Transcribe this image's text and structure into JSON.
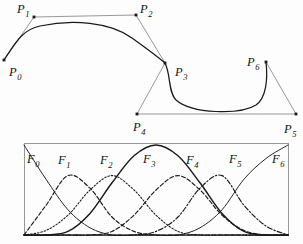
{
  "figure": {
    "title_text": "",
    "background_color": "#ffffff",
    "ink_color": "#1a1a1a",
    "polygon_color": "#8e8e8e"
  },
  "control_polygon": {
    "name": "control-polygon",
    "points": [
      {
        "label": "P",
        "sub": "0",
        "x": 4,
        "y": 60,
        "lx": 9,
        "ly": 76
      },
      {
        "label": "P",
        "sub": "1",
        "x": 34,
        "y": 17,
        "lx": 17,
        "ly": 13
      },
      {
        "label": "P",
        "sub": "2",
        "x": 136,
        "y": 15,
        "lx": 140,
        "ly": 13
      },
      {
        "label": "P",
        "sub": "3",
        "x": 165,
        "y": 63,
        "lx": 175,
        "ly": 76
      },
      {
        "label": "P",
        "sub": "4",
        "x": 137,
        "y": 114,
        "lx": 133,
        "ly": 131
      },
      {
        "label": "P",
        "sub": "5",
        "x": 296,
        "y": 114,
        "lx": 284,
        "ly": 133
      },
      {
        "label": "P",
        "sub": "6",
        "x": 266,
        "y": 62,
        "lx": 247,
        "ly": 66
      }
    ],
    "hull_path": "M4,60 L34,17 L136,15 L165,63 L137,114 L296,114 L266,62",
    "curve_path_upper": "M4,60 C16,42 22,30 40,26 C72,19 110,22 132,38 C150,51 158,57 165,63",
    "curve_path_lower": "M165,63 C171,75 168,92 176,100 C192,114 240,115 256,105 C266,98 268,80 266,62"
  },
  "basis_plot": {
    "name": "basis-function-plot",
    "frame": {
      "x": 24,
      "y": 143,
      "width": 264,
      "height": 92
    },
    "axis_note": "",
    "curves": [
      {
        "label": "F",
        "sub": "0",
        "lx": 27,
        "ly": 163,
        "style": "solid-thin"
      },
      {
        "label": "F",
        "sub": "1",
        "lx": 58,
        "ly": 164,
        "style": "dashed"
      },
      {
        "label": "F",
        "sub": "2",
        "lx": 100,
        "ly": 164,
        "style": "dotted"
      },
      {
        "label": "F",
        "sub": "3",
        "lx": 143,
        "ly": 163,
        "style": "solid-thick"
      },
      {
        "label": "F",
        "sub": "4",
        "lx": 186,
        "ly": 164,
        "style": "dashed"
      },
      {
        "label": "F",
        "sub": "5",
        "lx": 229,
        "ly": 163,
        "style": "dash-dot"
      },
      {
        "label": "F",
        "sub": "6",
        "lx": 272,
        "ly": 163,
        "style": "solid-thin"
      }
    ]
  },
  "chart_data": {
    "type": "line",
    "xlabel": "",
    "ylabel": "",
    "xlim": [
      0,
      6
    ],
    "ylim": [
      0,
      1
    ],
    "grid": false,
    "legend": "inline-labels",
    "x": [
      0,
      0.5,
      1,
      1.5,
      2,
      2.5,
      3,
      3.5,
      4,
      4.5,
      5,
      5.5,
      6
    ],
    "series": [
      {
        "name": "F0",
        "peak_x": 0.0,
        "peak_y": 1.0,
        "values": [
          1.0,
          0.62,
          0.28,
          0.08,
          0.0,
          0.0,
          0.0,
          0.0,
          0.0,
          0.0,
          0.0,
          0.0,
          0.0
        ]
      },
      {
        "name": "F1",
        "peak_x": 1.0,
        "peak_y": 0.66,
        "values": [
          0.0,
          0.33,
          0.66,
          0.52,
          0.2,
          0.04,
          0.0,
          0.0,
          0.0,
          0.0,
          0.0,
          0.0,
          0.0
        ]
      },
      {
        "name": "F2",
        "peak_x": 2.0,
        "peak_y": 0.66,
        "values": [
          0.0,
          0.05,
          0.22,
          0.5,
          0.66,
          0.5,
          0.22,
          0.04,
          0.0,
          0.0,
          0.0,
          0.0,
          0.0
        ]
      },
      {
        "name": "F3",
        "peak_x": 3.0,
        "peak_y": 1.0,
        "values": [
          0.0,
          0.0,
          0.04,
          0.24,
          0.58,
          0.88,
          1.0,
          0.88,
          0.58,
          0.24,
          0.04,
          0.0,
          0.0
        ]
      },
      {
        "name": "F4",
        "peak_x": 4.0,
        "peak_y": 0.66,
        "values": [
          0.0,
          0.0,
          0.0,
          0.0,
          0.04,
          0.22,
          0.5,
          0.66,
          0.5,
          0.22,
          0.05,
          0.0,
          0.0
        ]
      },
      {
        "name": "F5",
        "peak_x": 5.0,
        "peak_y": 0.66,
        "values": [
          0.0,
          0.0,
          0.0,
          0.0,
          0.0,
          0.0,
          0.04,
          0.2,
          0.52,
          0.66,
          0.33,
          0.1,
          0.0
        ]
      },
      {
        "name": "F6",
        "peak_x": 6.0,
        "peak_y": 1.0,
        "values": [
          0.0,
          0.0,
          0.0,
          0.0,
          0.0,
          0.0,
          0.0,
          0.0,
          0.08,
          0.28,
          0.62,
          0.85,
          1.0
        ]
      }
    ]
  }
}
